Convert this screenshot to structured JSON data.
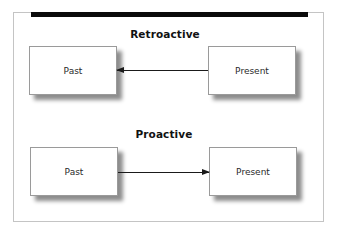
{
  "diagram": {
    "sections": [
      {
        "title": "Retroactive",
        "left_box": "Past",
        "right_box": "Present",
        "arrow_direction": "right-to-left"
      },
      {
        "title": "Proactive",
        "left_box": "Past",
        "right_box": "Present",
        "arrow_direction": "left-to-right"
      }
    ]
  },
  "colors": {
    "top_bar": "#0a0a0a",
    "frame_border": "#c4c4c4",
    "box_border": "#9a9a9a",
    "arrow": "#1a1a1a"
  }
}
